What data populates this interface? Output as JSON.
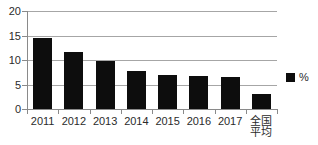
{
  "chart_data": {
    "type": "bar",
    "title": "",
    "subtitle": "",
    "xlabel": "",
    "ylabel": "",
    "categories": [
      "2011",
      "2012",
      "2013",
      "2014",
      "2015",
      "2016",
      "2017",
      "全国\n平均"
    ],
    "values": [
      14.5,
      11.7,
      9.8,
      7.7,
      7.0,
      6.8,
      6.5,
      3.1
    ],
    "series": [
      {
        "name": "%",
        "values": [
          14.5,
          11.7,
          9.8,
          7.7,
          7.0,
          6.8,
          6.5,
          3.1
        ],
        "color": "#0d0d0d"
      }
    ],
    "ylim": [
      0,
      20
    ],
    "ytick_labels": [
      "20",
      "15",
      "10",
      "5",
      "0"
    ],
    "ytick_values": [
      20,
      15,
      10,
      5,
      0
    ],
    "grid": true,
    "grid_axis": "y",
    "legend": {
      "position": "right",
      "entries": [
        {
          "label": "%",
          "color": "#0d0d0d",
          "marker": "square"
        }
      ]
    },
    "colors": {
      "bar": "#0d0d0d",
      "gridline": "#a6a6a6",
      "axis": "#8a8a8a",
      "text": "#2b2b2b",
      "background": "#ffffff"
    }
  }
}
